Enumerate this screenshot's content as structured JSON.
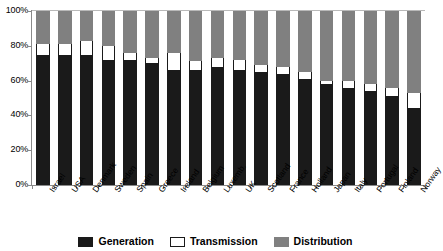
{
  "chart_data": {
    "type": "bar",
    "stacked": true,
    "title": "",
    "subtitle": "",
    "xlabel": "",
    "ylabel": "",
    "ylim": [
      0,
      100
    ],
    "ytick_labels": [
      "100%",
      "80%",
      "60%",
      "40%",
      "20%",
      "0%"
    ],
    "ytick_values": [
      100,
      80,
      60,
      40,
      20,
      0
    ],
    "grid": false,
    "legend_position": "bottom",
    "categories": [
      "Israel",
      "USA",
      "Denmark",
      "Sweden",
      "Spain",
      "Greece",
      "Ireland",
      "Belgium",
      "Luxemb.",
      "UK",
      "Scotland",
      "France",
      "Holland",
      "Japan",
      "Italy",
      "Portugal",
      "Finland",
      "Norway"
    ],
    "series": [
      {
        "name": "Generation",
        "color": "#1a1a1a",
        "values": [
          75,
          75,
          75,
          72,
          72,
          70,
          66,
          66,
          68,
          66,
          65,
          64,
          61,
          58,
          56,
          54,
          51,
          44
        ]
      },
      {
        "name": "Transmission",
        "color": "#ffffff",
        "values": [
          6,
          6,
          8,
          8,
          4,
          3,
          10,
          5,
          5,
          6,
          4,
          4,
          4,
          2,
          4,
          4,
          5,
          9
        ]
      },
      {
        "name": "Distribution",
        "color": "#808080",
        "values": [
          19,
          19,
          17,
          20,
          24,
          27,
          24,
          29,
          27,
          28,
          31,
          32,
          35,
          40,
          40,
          42,
          44,
          47
        ]
      }
    ]
  },
  "legend": {
    "items": [
      {
        "label": "Generation",
        "swatch": "sw-gen"
      },
      {
        "label": "Transmission",
        "swatch": "sw-trans"
      },
      {
        "label": "Distribution",
        "swatch": "sw-dist"
      }
    ]
  }
}
